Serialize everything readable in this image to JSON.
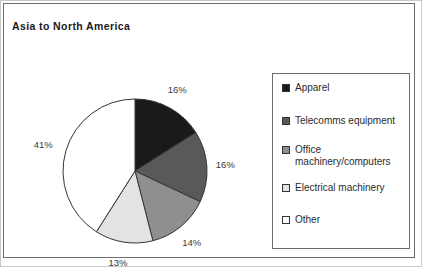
{
  "frame": {
    "border_color": "#6d6d6d",
    "background": "#ffffff"
  },
  "title": "Asia to North America",
  "chart_data": {
    "type": "pie",
    "title": "Asia to North America",
    "xlabel": "",
    "ylabel": "",
    "start_angle_deg": 0,
    "direction": "clockwise",
    "legend_position": "right",
    "grid": false,
    "categories": [
      "Apparel",
      "Telecomms equipment",
      "Office machinery/computers",
      "Electrical machinery",
      "Other"
    ],
    "values": [
      16,
      16,
      14,
      13,
      41
    ],
    "value_labels": [
      "16%",
      "16%",
      "14%",
      "13%",
      "41%"
    ],
    "colors": [
      "#1a1a1a",
      "#595959",
      "#8f8f8f",
      "#e3e3e3",
      "#ffffff"
    ],
    "slice_border_color": "#333333",
    "units": "percent"
  },
  "legend": {
    "items": [
      {
        "label": "Apparel",
        "color": "#1a1a1a"
      },
      {
        "label": "Telecomms equipment",
        "color": "#595959"
      },
      {
        "label": "Office machinery/computers",
        "color": "#8f8f8f"
      },
      {
        "label": "Electrical machinery",
        "color": "#e3e3e3"
      },
      {
        "label": "Other",
        "color": "#ffffff"
      }
    ]
  }
}
